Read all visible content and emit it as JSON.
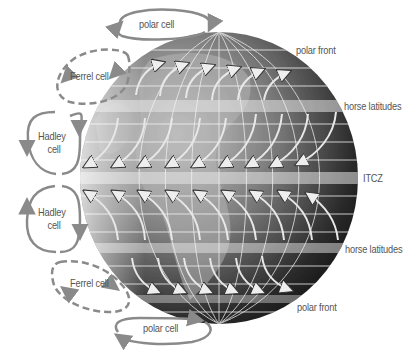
{
  "diagram": {
    "colors": {
      "background": "#ffffff",
      "cell_outline": "#8a8a8a",
      "label_text": "#555555",
      "globe_dark": "#1a1a1a",
      "globe_light": "#d8d8d8",
      "grid_lines": "#f0f0f0",
      "wind_arrows": "#e8e8e8"
    },
    "cells_left": [
      {
        "id": "polar-cell-north",
        "label": "polar cell",
        "style": "solid"
      },
      {
        "id": "ferrel-cell-north",
        "label": "Ferrel cell",
        "style": "dashed"
      },
      {
        "id": "hadley-cell-north",
        "label_line1": "Hadley",
        "label_line2": "cell",
        "style": "solid"
      },
      {
        "id": "hadley-cell-south",
        "label_line1": "Hadley",
        "label_line2": "cell",
        "style": "solid"
      },
      {
        "id": "ferrel-cell-south",
        "label": "Ferrel cell",
        "style": "dashed"
      },
      {
        "id": "polar-cell-south",
        "label": "polar cell",
        "style": "solid"
      }
    ],
    "zones_right": [
      {
        "id": "polar-front-north",
        "label": "polar front"
      },
      {
        "id": "horse-latitudes-north",
        "label": "horse latitudes"
      },
      {
        "id": "itcz",
        "label": "ITCZ"
      },
      {
        "id": "horse-latitudes-south",
        "label": "horse latitudes"
      },
      {
        "id": "polar-front-south",
        "label": "polar front"
      }
    ]
  }
}
